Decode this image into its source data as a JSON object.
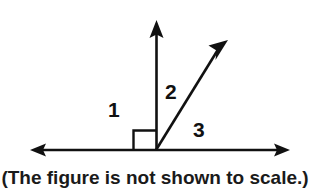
{
  "figure": {
    "type": "geometry-diagram",
    "caption": "(The figure is not shown to scale.)",
    "stroke_color": "#111111",
    "background_color": "#ffffff",
    "labels": [
      {
        "id": "1",
        "text": "1",
        "description": "angle between left ray and vertical ray, marked as right angle"
      },
      {
        "id": "2",
        "text": "2",
        "description": "angle between vertical ray and diagonal ray"
      },
      {
        "id": "3",
        "text": "3",
        "description": "angle between diagonal ray and right ray"
      }
    ],
    "right_angle_marker": {
      "present": true,
      "angle_id": "1",
      "measure": "90"
    },
    "geometry": {
      "vertex": {
        "x": 156,
        "y": 150
      },
      "rays": [
        {
          "name": "left-ray",
          "tip": {
            "x": 30,
            "y": 150
          },
          "arrow": true
        },
        {
          "name": "right-ray",
          "tip": {
            "x": 290,
            "y": 150
          },
          "arrow": true
        },
        {
          "name": "vertical-ray",
          "tip": {
            "x": 157,
            "y": 20
          },
          "arrow": true
        },
        {
          "name": "diagonal-ray",
          "tip": {
            "x": 228,
            "y": 40
          },
          "arrow": true
        }
      ],
      "right_angle_square": {
        "x": 133,
        "y": 130,
        "size": 23
      }
    }
  }
}
